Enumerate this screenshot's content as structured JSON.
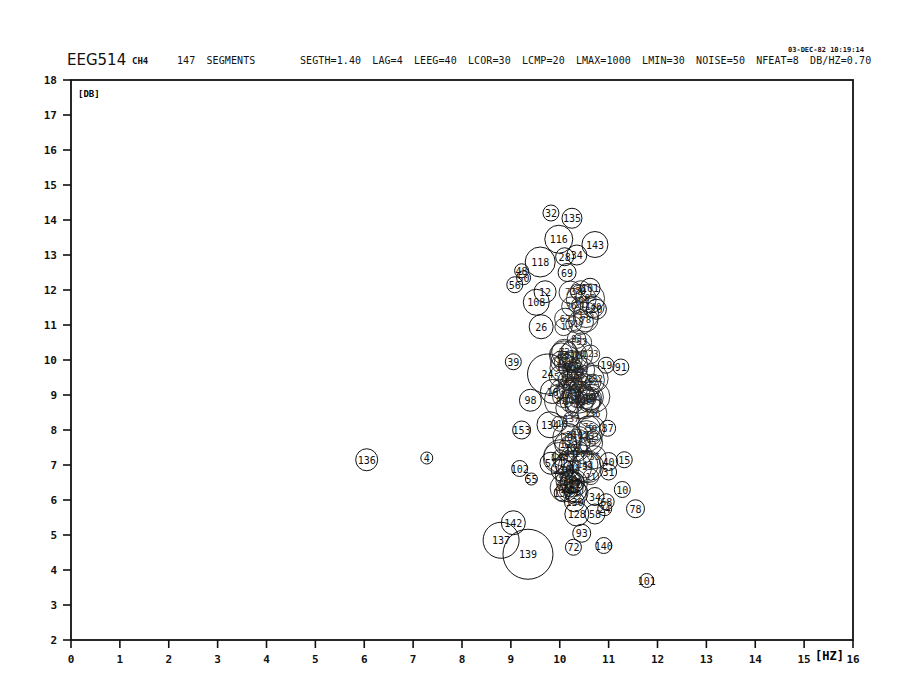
{
  "header": {
    "title": "EEG514",
    "channel": "CH4",
    "segments": "147 SEGMENTS",
    "parameters": "SEGTH=1.40  LAG=4  LEEG=40  LCOR=30  LCMP=20  LMAX=1000  LMIN=30  NOISE=50  NFEAT=8  DB/HZ=0.70",
    "parameter_list": [
      {
        "name": "SEGTH",
        "value": "1.40"
      },
      {
        "name": "LAG",
        "value": "4"
      },
      {
        "name": "LEEG",
        "value": "40"
      },
      {
        "name": "LCOR",
        "value": "30"
      },
      {
        "name": "LCMP",
        "value": "20"
      },
      {
        "name": "LMAX",
        "value": "1000"
      },
      {
        "name": "LMIN",
        "value": "30"
      },
      {
        "name": "NOISE",
        "value": "50"
      },
      {
        "name": "NFEAT",
        "value": "8"
      },
      {
        "name": "DB/HZ",
        "value": "0.70"
      }
    ],
    "datetime": "03-DEC-82 10:19:14"
  },
  "chart_data": {
    "type": "scatter",
    "xlabel": "[HZ]",
    "ylabel": "[DB]",
    "xlim": [
      0,
      16
    ],
    "ylim": [
      2,
      18
    ],
    "x_ticks": [
      0,
      1,
      2,
      3,
      4,
      5,
      6,
      7,
      8,
      9,
      10,
      11,
      12,
      13,
      14,
      15,
      16
    ],
    "y_ticks": [
      2,
      3,
      4,
      5,
      6,
      7,
      8,
      9,
      10,
      11,
      12,
      13,
      14,
      15,
      16,
      17,
      18
    ],
    "grid": false,
    "legend": null,
    "marker": "open circle labelled with segment number; circle radius proportional to segment length",
    "points": [
      {
        "label": "32",
        "x": 9.82,
        "y": 14.2,
        "r": 8
      },
      {
        "label": "135",
        "x": 10.25,
        "y": 14.05,
        "r": 10
      },
      {
        "label": "116",
        "x": 9.98,
        "y": 13.45,
        "r": 14
      },
      {
        "label": "143",
        "x": 10.72,
        "y": 13.3,
        "r": 13
      },
      {
        "label": "34",
        "x": 10.35,
        "y": 13.0,
        "r": 10
      },
      {
        "label": "28",
        "x": 10.1,
        "y": 12.95,
        "r": 9
      },
      {
        "label": "118",
        "x": 9.6,
        "y": 12.8,
        "r": 15
      },
      {
        "label": "48",
        "x": 9.22,
        "y": 12.55,
        "r": 7
      },
      {
        "label": "50",
        "x": 9.26,
        "y": 12.35,
        "r": 7
      },
      {
        "label": "56",
        "x": 9.08,
        "y": 12.15,
        "r": 8
      },
      {
        "label": "69",
        "x": 10.15,
        "y": 12.5,
        "r": 9
      },
      {
        "label": "12",
        "x": 9.7,
        "y": 11.95,
        "r": 11
      },
      {
        "label": "101",
        "x": 10.62,
        "y": 12.05,
        "r": 10
      },
      {
        "label": "108",
        "x": 9.52,
        "y": 11.65,
        "r": 13
      },
      {
        "label": "20",
        "x": 10.75,
        "y": 11.45,
        "r": 10
      },
      {
        "label": "26",
        "x": 9.62,
        "y": 10.95,
        "r": 12
      },
      {
        "label": "39",
        "x": 9.05,
        "y": 9.95,
        "r": 8
      },
      {
        "label": "19",
        "x": 10.95,
        "y": 9.85,
        "r": 8
      },
      {
        "label": "91",
        "x": 11.25,
        "y": 9.8,
        "r": 8
      },
      {
        "label": "24",
        "x": 9.75,
        "y": 9.6,
        "r": 20
      },
      {
        "label": "16",
        "x": 9.85,
        "y": 9.1,
        "r": 12
      },
      {
        "label": "98",
        "x": 9.4,
        "y": 8.85,
        "r": 11
      },
      {
        "label": "87",
        "x": 10.98,
        "y": 8.05,
        "r": 8
      },
      {
        "label": "134",
        "x": 9.8,
        "y": 8.15,
        "r": 13
      },
      {
        "label": "153",
        "x": 9.22,
        "y": 8.0,
        "r": 9
      },
      {
        "label": "12b",
        "x": 10.12,
        "y": 7.6,
        "r": 11
      },
      {
        "label": "40",
        "x": 11.0,
        "y": 7.1,
        "r": 9
      },
      {
        "label": "15",
        "x": 11.32,
        "y": 7.15,
        "r": 8
      },
      {
        "label": "136",
        "x": 6.05,
        "y": 7.15,
        "r": 11
      },
      {
        "label": "4",
        "x": 7.28,
        "y": 7.2,
        "r": 6
      },
      {
        "label": "102",
        "x": 9.18,
        "y": 6.9,
        "r": 8
      },
      {
        "label": "57",
        "x": 9.82,
        "y": 7.05,
        "r": 11
      },
      {
        "label": "130",
        "x": 10.05,
        "y": 6.85,
        "r": 11
      },
      {
        "label": "31",
        "x": 11.0,
        "y": 6.8,
        "r": 8
      },
      {
        "label": "55",
        "x": 9.42,
        "y": 6.6,
        "r": 6
      },
      {
        "label": "27",
        "x": 10.3,
        "y": 6.5,
        "r": 10
      },
      {
        "label": "75",
        "x": 10.32,
        "y": 6.25,
        "r": 11
      },
      {
        "label": "10",
        "x": 11.28,
        "y": 6.3,
        "r": 8
      },
      {
        "label": "138",
        "x": 10.05,
        "y": 6.2,
        "r": 8
      },
      {
        "label": "34b",
        "x": 10.72,
        "y": 6.1,
        "r": 9
      },
      {
        "label": "130b",
        "x": 10.3,
        "y": 5.95,
        "r": 10
      },
      {
        "label": "68",
        "x": 10.95,
        "y": 5.95,
        "r": 8
      },
      {
        "label": "24b",
        "x": 10.92,
        "y": 5.75,
        "r": 7
      },
      {
        "label": "78",
        "x": 11.55,
        "y": 5.75,
        "r": 9
      },
      {
        "label": "128",
        "x": 10.35,
        "y": 5.6,
        "r": 12
      },
      {
        "label": "58",
        "x": 10.72,
        "y": 5.6,
        "r": 10
      },
      {
        "label": "93",
        "x": 10.45,
        "y": 5.05,
        "r": 9
      },
      {
        "label": "142",
        "x": 9.05,
        "y": 5.35,
        "r": 12
      },
      {
        "label": "137",
        "x": 8.8,
        "y": 4.85,
        "r": 18
      },
      {
        "label": "139",
        "x": 9.35,
        "y": 4.45,
        "r": 25
      },
      {
        "label": "72",
        "x": 10.28,
        "y": 4.65,
        "r": 8
      },
      {
        "label": "140",
        "x": 10.9,
        "y": 4.7,
        "r": 8
      },
      {
        "label": "101b",
        "x": 11.78,
        "y": 3.7,
        "r": 7
      }
    ]
  }
}
